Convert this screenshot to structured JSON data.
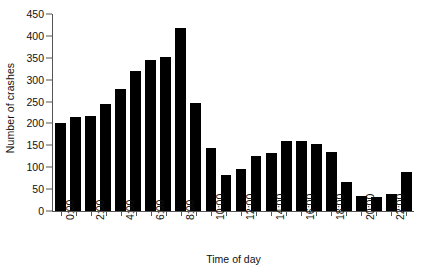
{
  "chart_data": {
    "type": "bar",
    "title": "",
    "xlabel": "Time of day",
    "ylabel": "Number of crashes",
    "categories": [
      "0:00",
      "1:00",
      "2:00",
      "3:00",
      "4:00",
      "5:00",
      "6:00",
      "7:00",
      "8:00",
      "9:00",
      "10:00",
      "11:00",
      "12:00",
      "13:00",
      "14:00",
      "15:00",
      "16:00",
      "17:00",
      "18:00",
      "19:00",
      "20:00",
      "21:00",
      "22:00",
      "23:00"
    ],
    "values": [
      200,
      214,
      217,
      245,
      278,
      319,
      345,
      352,
      419,
      247,
      145,
      82,
      95,
      126,
      133,
      160,
      160,
      152,
      134,
      67,
      35,
      33,
      38,
      90
    ],
    "ylim": [
      0,
      450
    ],
    "yticks": [
      0,
      50,
      100,
      150,
      200,
      250,
      300,
      350,
      400,
      450
    ],
    "ytick_labels": [
      "0",
      "50",
      "100",
      "150",
      "200",
      "250",
      "300",
      "350",
      "400",
      "450"
    ],
    "xtick_labels": [
      "0:00",
      "2:00",
      "4:00",
      "6:00",
      "8:00",
      "10:00",
      "12:00",
      "14:00",
      "16:00",
      "18:00",
      "20:00",
      "22:00"
    ],
    "xtick_category_indices": [
      0,
      2,
      4,
      6,
      8,
      10,
      12,
      14,
      16,
      18,
      20,
      22
    ],
    "grid": false,
    "legend": false,
    "bar_color": "#000000",
    "axis_color": "#555555",
    "background_color": "#ffffff",
    "text_color": "#111111"
  }
}
